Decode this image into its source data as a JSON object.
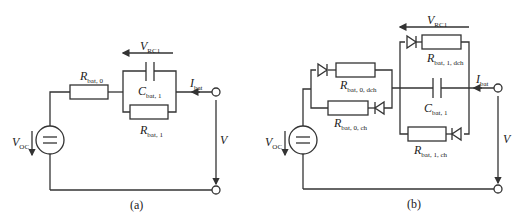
{
  "figure": {
    "panel_a": {
      "caption": "(a)",
      "labels": {
        "v_rc1": {
          "main": "V",
          "sub": "RC1"
        },
        "r_bat_0": {
          "main": "R",
          "sub": "bat, 0"
        },
        "c_bat_1": {
          "main": "C",
          "sub": "bat, 1"
        },
        "r_bat_1": {
          "main": "R",
          "sub": "bat, 1"
        },
        "i_bat": {
          "main": "I",
          "sub": "bat"
        },
        "v_oc": {
          "main": "V",
          "sub": "OC"
        },
        "v": {
          "main": "V"
        }
      }
    },
    "panel_b": {
      "caption": "(b)",
      "labels": {
        "v_rc1": {
          "main": "V",
          "sub": "RC1"
        },
        "r_bat_0_dch": {
          "main": "R",
          "sub": "bat, 0, dch"
        },
        "r_bat_0_ch": {
          "main": "R",
          "sub": "bat, 0, ch"
        },
        "r_bat_1_dch": {
          "main": "R",
          "sub": "bat, 1, dch"
        },
        "r_bat_1_ch": {
          "main": "R",
          "sub": "bat, 1, ch"
        },
        "c_bat_1": {
          "main": "C",
          "sub": "bat, 1"
        },
        "i_bat": {
          "main": "I",
          "sub": "bat"
        },
        "v_oc": {
          "main": "V",
          "sub": "OC"
        },
        "v": {
          "main": "V"
        }
      }
    }
  }
}
